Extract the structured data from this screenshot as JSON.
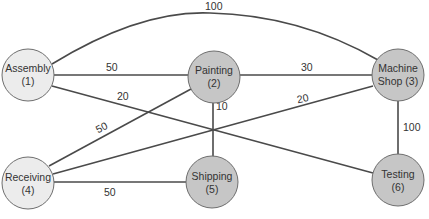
{
  "diagram": {
    "colors": {
      "node_light": "#ececec",
      "node_dark": "#c6c6c6",
      "edge": "#4a4a4a",
      "text": "#333333"
    },
    "nodes": [
      {
        "id": 1,
        "name": "Assembly",
        "number": "(1)",
        "line1": "Assembly",
        "line2": "(1)",
        "shade": "light"
      },
      {
        "id": 2,
        "name": "Painting",
        "number": "(2)",
        "line1": "Painting",
        "line2": "(2)",
        "shade": "dark"
      },
      {
        "id": 3,
        "name": "Machine Shop",
        "number": "(3)",
        "line1": "Machine",
        "line2": "Shop (3)",
        "shade": "dark"
      },
      {
        "id": 4,
        "name": "Receiving",
        "number": "(4)",
        "line1": "Receiving",
        "line2": "(4)",
        "shade": "light"
      },
      {
        "id": 5,
        "name": "Shipping",
        "number": "(5)",
        "line1": "Shipping",
        "line2": "(5)",
        "shade": "dark"
      },
      {
        "id": 6,
        "name": "Testing",
        "number": "(6)",
        "line1": "Testing",
        "line2": "(6)",
        "shade": "dark"
      }
    ],
    "edges": [
      {
        "from": 1,
        "to": 3,
        "weight": "100"
      },
      {
        "from": 1,
        "to": 2,
        "weight": "50"
      },
      {
        "from": 2,
        "to": 3,
        "weight": "30"
      },
      {
        "from": 1,
        "to": 6,
        "weight": "20"
      },
      {
        "from": 2,
        "to": 5,
        "weight": "10"
      },
      {
        "from": 4,
        "to": 3,
        "weight": "20"
      },
      {
        "from": 4,
        "to": 2,
        "weight": "50"
      },
      {
        "from": 3,
        "to": 6,
        "weight": "100"
      },
      {
        "from": 4,
        "to": 5,
        "weight": "50"
      }
    ]
  }
}
